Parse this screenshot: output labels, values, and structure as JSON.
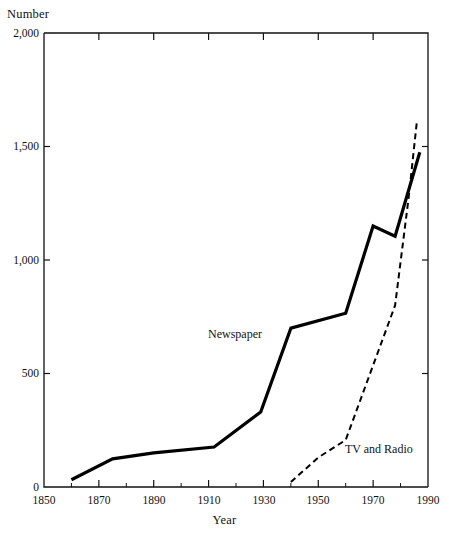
{
  "chart_data": {
    "type": "line",
    "title": "",
    "xlabel": "Year",
    "ylabel": "Number",
    "xlim": [
      1850,
      1990
    ],
    "ylim": [
      0,
      2000
    ],
    "grid": false,
    "legend_position": "inline-annotation",
    "x_ticks": [
      1850,
      1870,
      1890,
      1910,
      1930,
      1950,
      1970,
      1990
    ],
    "x_tick_labels": [
      "1850",
      "1870",
      "1890",
      "1910",
      "1930",
      "1950",
      "1970",
      "1990"
    ],
    "x_minor_ticks": [
      1860,
      1880,
      1900,
      1920,
      1940,
      1960,
      1980
    ],
    "y_ticks": [
      0,
      500,
      1000,
      1500,
      2000
    ],
    "y_tick_labels": [
      "0",
      "500",
      "1,000",
      "1,500",
      "2,000"
    ],
    "series": [
      {
        "name": "Newspaper",
        "style": "solid",
        "color": "#000000",
        "label_text": "Newspaper",
        "x": [
          1860,
          1875,
          1890,
          1912,
          1929,
          1940,
          1960,
          1970,
          1978,
          1987
        ],
        "y": [
          32,
          124,
          150,
          176,
          330,
          700,
          765,
          1150,
          1105,
          1475
        ]
      },
      {
        "name": "TV and Radio",
        "style": "dashed",
        "color": "#000000",
        "label_text": "TV and Radio",
        "x": [
          1940,
          1950,
          1960,
          1978,
          1983,
          1986
        ],
        "y": [
          22,
          130,
          207,
          800,
          1280,
          1615
        ]
      }
    ]
  },
  "axes": {
    "y_axis_title": "Number",
    "x_axis_title": "Year"
  }
}
